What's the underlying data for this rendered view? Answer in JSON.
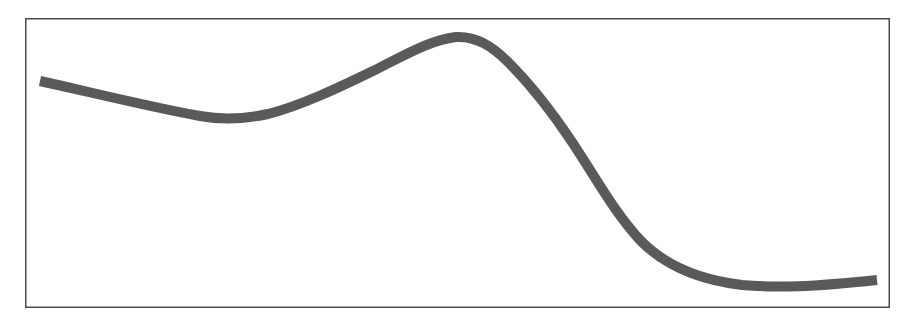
{
  "figure": {
    "background_color": "#ffffff",
    "plot_background_color": "#ffffff",
    "frame_color": "#4a4a4a",
    "frame_width_px": 1.5,
    "frame": {
      "x": 25,
      "y": 18,
      "width": 865,
      "height": 290
    }
  },
  "chart_data": {
    "type": "line",
    "title": "",
    "subtitle": "",
    "xlabel": "",
    "ylabel": "",
    "grid": false,
    "legend": null,
    "legend_position": "none",
    "axis_ticks": [],
    "tick_labels": [],
    "annotations": [],
    "xlim": [
      25,
      890
    ],
    "ylim": [
      308,
      18
    ],
    "series": [
      {
        "name": "curve",
        "color": "#5e5e5e",
        "line_width_px": 10,
        "line_cap": "butt",
        "smoothing": "cubic-bezier",
        "x": [
          40,
          90,
          140,
          190,
          230,
          275,
          320,
          365,
          410,
          455,
          480,
          510,
          545,
          580,
          610,
          640,
          670,
          700,
          730,
          760,
          790,
          820,
          850,
          877
        ],
        "y": [
          81,
          92,
          103,
          113,
          118,
          114,
          103,
          85,
          60,
          38,
          41,
          52,
          75,
          110,
          150,
          192,
          228,
          253,
          270,
          280,
          285,
          285,
          282,
          280
        ],
        "path_d": "M 40,81 C 90,92 150,107 200,116 C 222,120 245,119 268,114 C 300,106 338,88 375,70 C 405,55 430,40 456,37 C 476,36 492,46 508,62 C 530,84 552,112 572,142 C 596,178 614,212 640,240 C 666,267 700,280 742,285 C 776,288 812,287 877,280"
      }
    ]
  },
  "curve_features": {
    "start_point": [
      40,
      81
    ],
    "local_minimum": [
      230,
      118
    ],
    "local_maximum": [
      456,
      37
    ],
    "inflection_descent": [
      600,
      165
    ],
    "tail_minimum": [
      800,
      285
    ],
    "end_point": [
      877,
      280
    ]
  }
}
